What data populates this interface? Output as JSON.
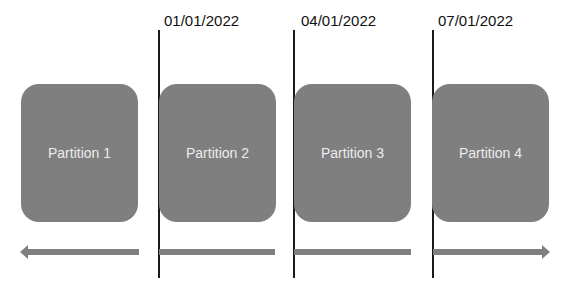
{
  "diagram": {
    "dates": [
      {
        "label": "01/01/2022"
      },
      {
        "label": "04/01/2022"
      },
      {
        "label": "07/01/2022"
      }
    ],
    "partitions": [
      {
        "label": "Partition 1"
      },
      {
        "label": "Partition 2"
      },
      {
        "label": "Partition 3"
      },
      {
        "label": "Partition 4"
      }
    ],
    "colors": {
      "partition_fill": "#7f7f7f",
      "partition_text": "#ececec",
      "boundary_line": "#1a1a1a",
      "arrow": "#7f7f7f"
    }
  }
}
